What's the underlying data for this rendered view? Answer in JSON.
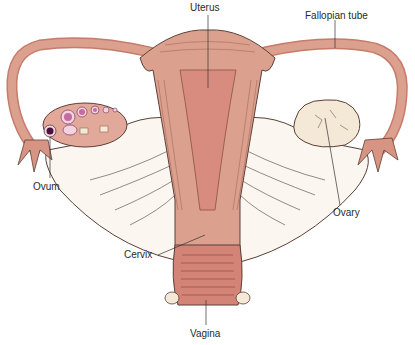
{
  "diagram": {
    "labels": {
      "uterus": "Uterus",
      "fallopian_tube": "Fallopian tube",
      "ovum": "Ovum",
      "ovary": "Ovary",
      "cervix": "Cervix",
      "vagina": "Vagina"
    },
    "colors": {
      "tissue": "#dca08e",
      "tissue_dark": "#c77b6b",
      "cavity": "#d88c80",
      "ligament": "#fbf6f0",
      "ovary": "#f4e8d6",
      "follicle": "#c76aa0",
      "outline": "#5a4038"
    }
  }
}
